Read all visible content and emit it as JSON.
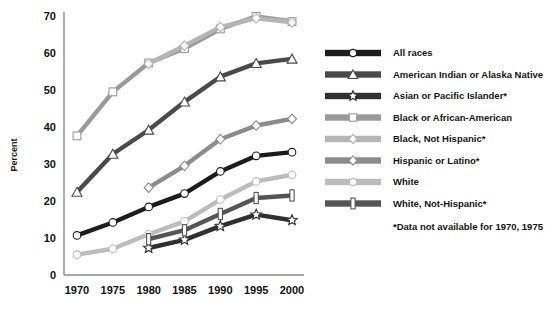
{
  "chart_data": {
    "type": "line",
    "title": "",
    "xlabel": "",
    "ylabel": "Percent",
    "categories": [
      "1970",
      "1975",
      "1980",
      "1985",
      "1990",
      "1995",
      "2000"
    ],
    "x": [
      1970,
      1975,
      1980,
      1985,
      1990,
      1995,
      2000
    ],
    "ylim": [
      0,
      70
    ],
    "yticks": [
      0,
      10,
      20,
      30,
      40,
      50,
      60,
      70
    ],
    "grid": false,
    "legend_position": "right",
    "footnote": "*Data not available for 1970, 1975",
    "series": [
      {
        "name": "All races",
        "marker": "circle",
        "color": "#1c1c1c",
        "values": [
          10.7,
          14.2,
          18.4,
          22.0,
          28.0,
          32.2,
          33.2
        ]
      },
      {
        "name": "American Indian or Alaska Native",
        "marker": "triangle",
        "color": "#4a4a4a",
        "values": [
          22.4,
          32.7,
          39.2,
          46.8,
          53.6,
          57.2,
          58.4
        ]
      },
      {
        "name": "Asian or Pacific Islander*",
        "marker": "star",
        "color": "#303030",
        "values": [
          null,
          null,
          7.3,
          9.5,
          13.2,
          16.3,
          14.8
        ]
      },
      {
        "name": "Black or African-American",
        "marker": "square",
        "color": "#9a9a9a",
        "values": [
          37.6,
          49.5,
          57.3,
          61.2,
          66.5,
          69.9,
          68.5
        ]
      },
      {
        "name": "Black, Not Hispanic*",
        "marker": "diamond",
        "color": "#b5b5b5",
        "values": [
          null,
          null,
          57.1,
          62.0,
          67.0,
          69.4,
          68.3
        ]
      },
      {
        "name": "Hispanic or Latino*",
        "marker": "diamond",
        "color": "#8c8c8c",
        "values": [
          null,
          null,
          23.6,
          29.5,
          36.7,
          40.4,
          42.2
        ]
      },
      {
        "name": "White",
        "marker": "circle",
        "color": "#bcbcbc",
        "values": [
          5.5,
          7.1,
          11.0,
          14.5,
          20.4,
          25.3,
          27.1
        ]
      },
      {
        "name": "White, Not-Hispanic*",
        "marker": "ibar",
        "color": "#555555",
        "values": [
          null,
          null,
          9.7,
          12.1,
          16.5,
          20.8,
          21.5
        ]
      }
    ]
  },
  "legend": {
    "items": [
      {
        "label": "All races"
      },
      {
        "label": "American Indian or Alaska Native"
      },
      {
        "label": "Asian or Pacific Islander*"
      },
      {
        "label": "Black or African-American"
      },
      {
        "label": "Black, Not Hispanic*"
      },
      {
        "label": "Hispanic or Latino*"
      },
      {
        "label": "White"
      },
      {
        "label": "White, Not-Hispanic*"
      }
    ],
    "footnote": "*Data not available for 1970, 1975"
  },
  "axes": {
    "y_title": "Percent",
    "y_ticks": [
      "0",
      "10",
      "20",
      "30",
      "40",
      "50",
      "60",
      "70"
    ],
    "x_ticks": [
      "1970",
      "1975",
      "1980",
      "1985",
      "1990",
      "1995",
      "2000"
    ]
  },
  "colors": {
    "axis": "#8a8a8a",
    "text": "#141414",
    "background": "#ffffff"
  }
}
